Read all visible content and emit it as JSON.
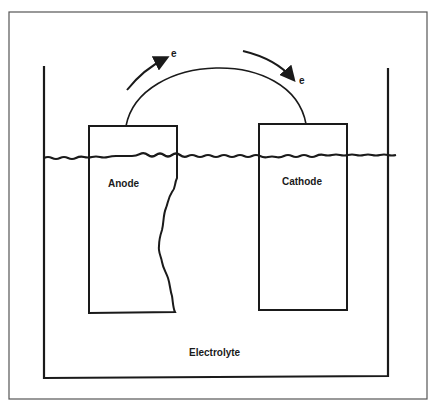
{
  "diagram": {
    "labels": {
      "anode": "Anode",
      "cathode": "Cathode",
      "electrolyte": "Electrolyte",
      "electron_left": "e",
      "electron_right": "e"
    },
    "colors": {
      "line": "#1a1a1a",
      "frame": "#555555",
      "background": "#ffffff"
    }
  }
}
